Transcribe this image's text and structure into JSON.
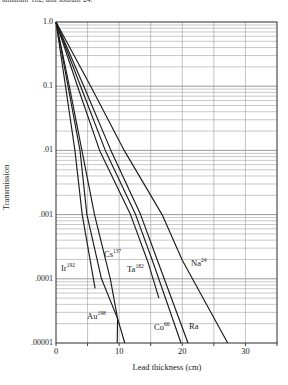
{
  "page": {
    "background": "#ffffff"
  },
  "caption_fragment": "tantalum-182, and sodium-24.",
  "chart_data": {
    "type": "line",
    "title": "",
    "caption_fragment_visible": "tantalum-182, and sodium-24.",
    "xlabel": "Lead thickness (cm)",
    "ylabel": "Transmission",
    "x_axis": {
      "min": 0,
      "max": 35,
      "tick_labels": [
        "0",
        "10",
        "20",
        "30"
      ],
      "tick_values": [
        0,
        10,
        20,
        30
      ],
      "minor_gridlines_cm": [
        5,
        10,
        15,
        20,
        25,
        30
      ]
    },
    "y_axis": {
      "scale": "log",
      "min": 1e-05,
      "max": 1.0,
      "tick_labels": [
        "1.0",
        "0.1",
        ".01",
        ".001",
        ".0001",
        ".00001"
      ],
      "tick_values": [
        1,
        0.1,
        0.01,
        0.001,
        0.0001,
        1e-05
      ]
    },
    "grid": "log-minor-horizontal, 5cm-vertical",
    "legend_position": "labels-on-plot",
    "series": [
      {
        "id": "ir192",
        "isotope": "Ir",
        "mass_number": "192",
        "label_px": [
          61,
          263
        ],
        "points_cm_negLog10T": [
          [
            0,
            0
          ],
          [
            1.5,
            1
          ],
          [
            3.0,
            2
          ],
          [
            4.15,
            3
          ],
          [
            6.2,
            4.15
          ]
        ]
      },
      {
        "id": "au198",
        "isotope": "Au",
        "mass_number": "198",
        "label_px": [
          87,
          311
        ],
        "points_cm_negLog10T": [
          [
            0,
            0
          ],
          [
            2.1,
            1
          ],
          [
            4.1,
            2
          ],
          [
            6.1,
            3
          ],
          [
            8.6,
            4
          ],
          [
            9.75,
            4.62
          ],
          [
            9.7,
            5
          ]
        ]
      },
      {
        "id": "cs137",
        "isotope": "Cs",
        "mass_number": "137",
        "label_px": [
          104,
          249
        ],
        "points_cm_negLog10T": [
          [
            0,
            0
          ],
          [
            1.9,
            1
          ],
          [
            3.8,
            2
          ],
          [
            4.9,
            3
          ],
          [
            7.2,
            4
          ],
          [
            9.75,
            4.62
          ],
          [
            10.9,
            5
          ]
        ]
      },
      {
        "id": "ta182",
        "isotope": "Ta",
        "mass_number": "182",
        "label_px": [
          127,
          264
        ],
        "points_cm_negLog10T": [
          [
            0,
            0
          ],
          [
            3.4,
            1
          ],
          [
            6.9,
            2
          ],
          [
            11.8,
            3
          ],
          [
            14.6,
            3.75
          ],
          [
            16.3,
            4.3
          ]
        ]
      },
      {
        "id": "co60",
        "isotope": "Co",
        "mass_number": "60",
        "label_px": [
          154,
          322
        ],
        "points_cm_negLog10T": [
          [
            0,
            0
          ],
          [
            3.9,
            1
          ],
          [
            7.8,
            2
          ],
          [
            12.6,
            3
          ],
          [
            15.4,
            3.75
          ],
          [
            19.8,
            5
          ]
        ]
      },
      {
        "id": "ra",
        "isotope": "Ra",
        "mass_number": "",
        "label_px": [
          189,
          322
        ],
        "points_cm_negLog10T": [
          [
            0,
            0
          ],
          [
            4.4,
            1
          ],
          [
            8.7,
            2
          ],
          [
            13.4,
            3
          ],
          [
            16.2,
            3.75
          ],
          [
            20.9,
            5
          ]
        ]
      },
      {
        "id": "na24",
        "isotope": "Na",
        "mass_number": "24",
        "label_px": [
          191,
          258
        ],
        "points_cm_negLog10T": [
          [
            0,
            0
          ],
          [
            5.5,
            1
          ],
          [
            10.8,
            2
          ],
          [
            16.8,
            3
          ],
          [
            20.0,
            3.71
          ],
          [
            27.2,
            5
          ]
        ]
      }
    ],
    "colors": {
      "line": "#1c1c1c",
      "grid": "#9a9a9a",
      "frame": "#2b2b2b",
      "text": "#1a1a1a"
    },
    "plot_px": {
      "left": 56,
      "top": 22,
      "right": 277,
      "bottom": 343
    }
  }
}
